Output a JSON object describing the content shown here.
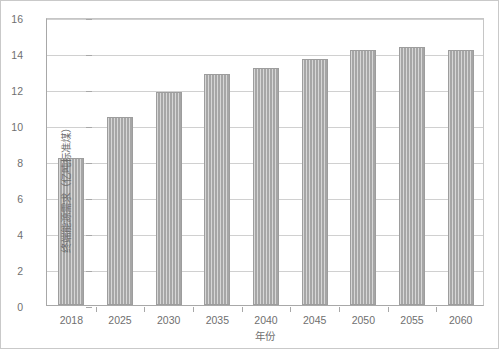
{
  "chart_data": {
    "type": "bar",
    "title": "",
    "categories": [
      "2018",
      "2025",
      "2030",
      "2035",
      "2040",
      "2045",
      "2050",
      "2055",
      "2060"
    ],
    "values": [
      8.15,
      10.45,
      11.85,
      12.85,
      13.15,
      13.65,
      14.15,
      14.35,
      14.15
    ],
    "xlabel": "年份",
    "ylabel": "终端能源需求（亿吨标准煤）",
    "ylim": [
      0,
      16
    ],
    "yticks": [
      0,
      2,
      4,
      6,
      8,
      10,
      12,
      14,
      16
    ],
    "ytick_labels": [
      "0",
      "2",
      "4",
      "6",
      "8",
      "10",
      "12",
      "14",
      "16"
    ],
    "grid": "horizontal",
    "legend": "none",
    "series_name": "终端能源需求",
    "bar_color": "#a6a6a6",
    "bar_pattern": "vertical-hatch",
    "axis_color": "#a8a8a8",
    "grid_color": "#d0d0d0",
    "text_color": "#6f6f6f",
    "background": "#ffffff"
  }
}
